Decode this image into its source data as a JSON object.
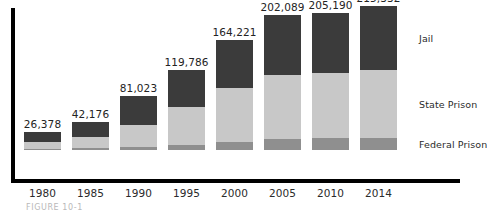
{
  "figure": {
    "caption": "FIGURE 10-1"
  },
  "legend": {
    "position": "right",
    "items": [
      {
        "label": "Jail",
        "color": "#3b3b3b",
        "key": "jail"
      },
      {
        "label": "State Prison",
        "color": "#c8c8c8",
        "key": "state"
      },
      {
        "label": "Federal Prison",
        "color": "#8f8f8f",
        "key": "federal"
      }
    ]
  },
  "chart_data": {
    "type": "bar",
    "stacked": true,
    "title": "",
    "subtitle": "",
    "xlabel": "",
    "ylabel": "",
    "grid": false,
    "legend_position": "right",
    "ylim": [
      0,
      215332
    ],
    "categories": [
      "1980",
      "1985",
      "1990",
      "1995",
      "2000",
      "2005",
      "2010",
      "2014"
    ],
    "totals": [
      26378,
      42176,
      81023,
      119786,
      164221,
      202089,
      205190,
      215332
    ],
    "total_labels": [
      "26,378",
      "42,176",
      "81,023",
      "119,786",
      "164,221",
      "202,089",
      "205,190",
      "215,332"
    ],
    "series": [
      {
        "name": "Federal Prison",
        "color": "#8f8f8f",
        "values": [
          1200,
          2300,
          4000,
          7200,
          12500,
          16800,
          17500,
          18000
        ]
      },
      {
        "name": "State Prison",
        "color": "#c8c8c8",
        "values": [
          10500,
          17300,
          34000,
          57500,
          81000,
          96000,
          97500,
          102000
        ]
      },
      {
        "name": "Jail",
        "color": "#3b3b3b",
        "values": [
          14678,
          22576,
          43023,
          55086,
          70721,
          89289,
          90190,
          95332
        ]
      }
    ]
  }
}
